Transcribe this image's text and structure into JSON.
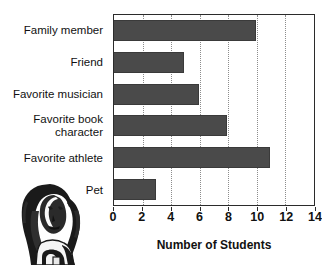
{
  "chart_data": {
    "type": "bar",
    "orientation": "horizontal",
    "title": "",
    "xlabel": "Number of Students",
    "ylabel": "",
    "categories": [
      "Family member",
      "Friend",
      "Favorite musician",
      "Favorite book character",
      "Favorite athlete",
      "Pet"
    ],
    "category_lines": [
      [
        "Family member"
      ],
      [
        "Friend"
      ],
      [
        "Favorite musician"
      ],
      [
        "Favorite book",
        "character"
      ],
      [
        "Favorite athlete"
      ],
      [
        "Pet"
      ]
    ],
    "values": [
      10,
      5,
      6,
      8,
      11,
      3
    ],
    "xlim": [
      0,
      14
    ],
    "xticks": [
      0,
      2,
      4,
      6,
      8,
      10,
      12,
      14
    ],
    "xtick_labels": [
      "0",
      "2",
      "4",
      "6",
      "8",
      "10",
      "12",
      "14"
    ],
    "grid": true,
    "grid_axis": "x",
    "grid_style": "dotted",
    "legend": false,
    "bar_color": "#4a4a4a",
    "axis_color": "#2b2b2b",
    "grid_color": "#8c8c8c"
  },
  "illustration": {
    "name": "person-engraving-illustration",
    "description": "black and white engraved drawing of a long-haired person"
  }
}
